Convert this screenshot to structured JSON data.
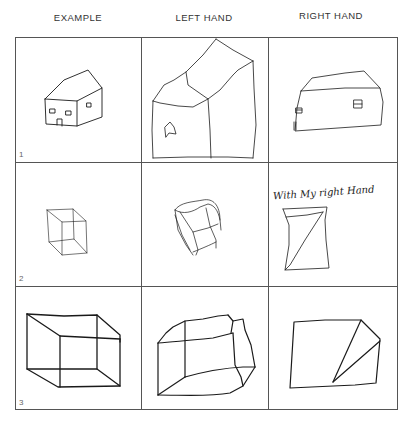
{
  "figure": {
    "columns": [
      {
        "label": "EXAMPLE"
      },
      {
        "label": "LEFT HAND"
      },
      {
        "label": "RIGHT HAND"
      }
    ],
    "rows": [
      {
        "number": "1",
        "subject": "house",
        "cells": [
          "example-house",
          "left-hand-house",
          "right-hand-house"
        ]
      },
      {
        "number": "2",
        "subject": "small cube",
        "cells": [
          "example-cube",
          "left-hand-cube",
          "right-hand-cube"
        ],
        "annotation": "With My right Hand"
      },
      {
        "number": "3",
        "subject": "large box",
        "cells": [
          "example-box",
          "left-hand-box",
          "right-hand-box"
        ]
      }
    ],
    "line_color": "#1a1a1a",
    "grid_color": "#555555"
  }
}
